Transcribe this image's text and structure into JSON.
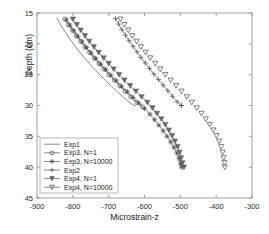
{
  "chart_data": {
    "type": "line",
    "title": "",
    "xlabel": "Microstrain-z",
    "ylabel": "Depth (cm)",
    "xlim": [
      -900,
      -300
    ],
    "ylim": [
      15,
      45
    ],
    "y_inverted": true,
    "xticks": [
      -900,
      -800,
      -700,
      -600,
      -500,
      -400,
      -300
    ],
    "yticks": [
      15,
      20,
      25,
      30,
      35,
      40,
      45
    ],
    "xtick_labels": [
      "-900",
      "-800",
      "-700",
      "-600",
      "-500",
      "-400",
      "-300"
    ],
    "ytick_labels": [
      "15",
      "20",
      "25",
      "30",
      "35",
      "40",
      "45"
    ],
    "grid": false,
    "legend_position": "lower left",
    "series": [
      {
        "name": "Exp1",
        "marker": "none",
        "line": "solid",
        "x": [
          -845,
          -838,
          -830,
          -821,
          -812,
          -802,
          -792,
          -781,
          -770,
          -758,
          -746,
          -733,
          -720,
          -706,
          -692,
          -677,
          -662,
          -646,
          -632,
          -624
        ],
        "y": [
          15.8,
          16.5,
          17.3,
          18.1,
          18.9,
          19.7,
          20.5,
          21.3,
          22.1,
          22.9,
          23.7,
          24.5,
          25.3,
          26.1,
          26.9,
          27.7,
          28.5,
          29.3,
          29.9,
          30.1
        ]
      },
      {
        "name": "Exp3, N=1",
        "marker": "circle-open",
        "line": "solid",
        "x": [
          -822,
          -812,
          -801,
          -790,
          -778,
          -766,
          -753,
          -740,
          -727,
          -713,
          -699,
          -684,
          -669,
          -654,
          -638,
          -622,
          -606
        ],
        "y": [
          16.0,
          16.9,
          17.8,
          18.7,
          19.6,
          20.5,
          21.4,
          22.3,
          23.2,
          24.1,
          25.0,
          25.9,
          26.8,
          27.7,
          28.6,
          29.5,
          30.2
        ]
      },
      {
        "name": "Exp3, N=10000",
        "marker": "asterisk",
        "line": "solid",
        "x": [
          -818,
          -808,
          -797,
          -786,
          -774,
          -762,
          -749,
          -736,
          -722,
          -708,
          -694,
          -679,
          -664,
          -648,
          -632,
          -616,
          -600,
          -585,
          -572,
          -560,
          -548,
          -537,
          -527,
          -518,
          -510,
          -504,
          -500,
          -497
        ],
        "y": [
          16.1,
          17.0,
          17.9,
          18.8,
          19.7,
          20.6,
          21.5,
          22.4,
          23.3,
          24.2,
          25.1,
          26.0,
          26.9,
          27.8,
          28.7,
          29.6,
          30.5,
          31.4,
          32.3,
          33.2,
          34.1,
          35.0,
          35.9,
          36.8,
          37.7,
          38.6,
          39.4,
          40.0
        ]
      },
      {
        "name": "Exp2",
        "marker": "plus",
        "line": "solid",
        "x": [
          -681,
          -672,
          -663,
          -653,
          -643,
          -632,
          -621,
          -610,
          -598,
          -586,
          -574,
          -561,
          -548,
          -535,
          -522,
          -509,
          -497,
          -497
        ],
        "y": [
          15.9,
          16.8,
          17.7,
          18.6,
          19.5,
          20.4,
          21.3,
          22.2,
          23.1,
          24.0,
          24.9,
          25.8,
          26.7,
          27.6,
          28.5,
          29.4,
          30.0,
          30.0
        ]
      },
      {
        "name": "Exp4, N=1",
        "marker": "triangle-down-filled",
        "line": "solid",
        "x": [
          -800,
          -789,
          -778,
          -766,
          -754,
          -741,
          -728,
          -714,
          -700,
          -686,
          -671,
          -656,
          -640,
          -624,
          -608,
          -592,
          -578,
          -565,
          -553,
          -542,
          -532,
          -523,
          -515,
          -508,
          -502,
          -498,
          -494,
          -490
        ],
        "y": [
          16.0,
          16.9,
          17.8,
          18.7,
          19.6,
          20.5,
          21.4,
          22.3,
          23.2,
          24.1,
          25.0,
          25.9,
          26.8,
          27.7,
          28.6,
          29.5,
          30.4,
          31.3,
          32.2,
          33.1,
          34.0,
          34.9,
          35.8,
          36.7,
          37.6,
          38.5,
          39.3,
          40.0
        ]
      },
      {
        "name": "Exp4, N=10000",
        "marker": "triangle-down-open",
        "line": "none",
        "x": [
          -667,
          -656,
          -645,
          -634,
          -622,
          -610,
          -597,
          -584,
          -570,
          -556,
          -542,
          -527,
          -512,
          -497,
          -482,
          -468,
          -454,
          -441,
          -429,
          -418,
          -408,
          -399,
          -392,
          -386,
          -382,
          -379,
          -377,
          -376
        ],
        "y": [
          16.0,
          16.9,
          17.8,
          18.7,
          19.6,
          20.5,
          21.4,
          22.3,
          23.2,
          24.1,
          25.0,
          25.9,
          26.8,
          27.7,
          28.6,
          29.5,
          30.4,
          31.3,
          32.2,
          33.1,
          34.0,
          34.9,
          35.8,
          36.7,
          37.6,
          38.5,
          39.3,
          40.0
        ]
      }
    ]
  },
  "axis": {
    "xlabel": "Microstrain-z",
    "ylabel": "Depth (cm)"
  },
  "legend": {
    "items": [
      {
        "label": "Exp1",
        "marker": "none"
      },
      {
        "label": "Exp3, N=1",
        "marker": "circle-open"
      },
      {
        "label": "Exp3, N=10000",
        "marker": "asterisk"
      },
      {
        "label": "Exp2",
        "marker": "plus"
      },
      {
        "label": "Exp4, N=1",
        "marker": "triangle-down-filled"
      },
      {
        "label": "Exp4, N=10000",
        "marker": "triangle-down-open"
      }
    ]
  },
  "colors": {
    "axis": "#8a8a8a",
    "line": "#555555",
    "marker": "#4a4a4a",
    "text": "#1a1a1a",
    "background": "#ffffff"
  }
}
